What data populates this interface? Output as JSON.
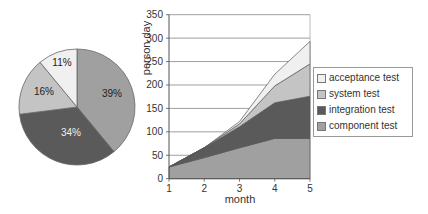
{
  "chart_data": [
    {
      "type": "pie",
      "title": "",
      "labels": [
        "component test",
        "integration test",
        "system test",
        "acceptance test"
      ],
      "values": [
        39,
        34,
        16,
        11
      ],
      "value_labels": [
        "39%",
        "34%",
        "16%",
        "11%"
      ],
      "colors": [
        "#a0a0a0",
        "#5a5a5a",
        "#c4c4c4",
        "#f0f0f0"
      ]
    },
    {
      "type": "area",
      "stacked": true,
      "title": "",
      "xlabel": "month",
      "ylabel": "person day",
      "x": [
        1,
        2,
        3,
        4,
        5
      ],
      "ylim": [
        0,
        350
      ],
      "yticks": [
        0,
        50,
        100,
        150,
        200,
        250,
        300,
        350
      ],
      "xticks": [
        1,
        2,
        3,
        4,
        5
      ],
      "grid": true,
      "legend_position": "right",
      "series": [
        {
          "name": "component test",
          "values": [
            25,
            45,
            66,
            86,
            86
          ],
          "color": "#a0a0a0"
        },
        {
          "name": "integration test",
          "values": [
            0,
            21,
            45,
            76,
            90
          ],
          "color": "#5a5a5a"
        },
        {
          "name": "system test",
          "values": [
            0,
            0,
            6,
            36,
            69
          ],
          "color": "#c4c4c4"
        },
        {
          "name": "acceptance test",
          "values": [
            0,
            0,
            5,
            25,
            48
          ],
          "color": "#f0f0f0"
        }
      ],
      "cumulative_tops": {
        "component test": [
          25,
          45,
          66,
          86,
          86
        ],
        "integration test": [
          25,
          66,
          111,
          162,
          176
        ],
        "system test": [
          25,
          66,
          117,
          198,
          245
        ],
        "acceptance test": [
          25,
          66,
          122,
          223,
          293
        ]
      }
    }
  ],
  "legend": {
    "items": [
      {
        "label": "acceptance test",
        "color": "#f0f0f0"
      },
      {
        "label": "system test",
        "color": "#c4c4c4"
      },
      {
        "label": "integration test",
        "color": "#5a5a5a"
      },
      {
        "label": "component test",
        "color": "#a0a0a0"
      }
    ]
  },
  "axis": {
    "ylabel": "person day",
    "xlabel": "month",
    "yticks": [
      "0",
      "50",
      "100",
      "150",
      "200",
      "250",
      "300",
      "350"
    ],
    "xticks": [
      "1",
      "2",
      "3",
      "4",
      "5"
    ]
  },
  "pie_labels": {
    "component": "39%",
    "integration": "34%",
    "system": "16%",
    "acceptance": "11%"
  }
}
